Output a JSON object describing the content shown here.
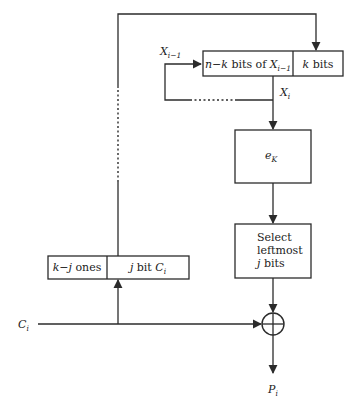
{
  "diagram": {
    "type": "Cipher Feedback (CFB) decryption block diagram",
    "shift_register": {
      "left_segment_label_prefix": "n−k bits of ",
      "left_segment_var": "X",
      "left_segment_sub": "i−1",
      "right_segment_label_var": "k",
      "right_segment_label_suffix": " bits"
    },
    "feedback_input_label": {
      "var": "X",
      "sub": "i−1"
    },
    "register_output_label": {
      "var": "X",
      "sub": "i"
    },
    "encrypt_box": {
      "var": "e",
      "sub": "K"
    },
    "select_box": {
      "line1": "Select",
      "line2": "leftmost",
      "line3_var": "j",
      "line3_suffix": " bits"
    },
    "padding_register": {
      "left_segment_var": "k−j",
      "left_segment_suffix": " ones",
      "right_segment_var": "j",
      "right_segment_mid": " bit ",
      "right_segment_ci_var": "C",
      "right_segment_ci_sub": "i"
    },
    "ciphertext_input": {
      "var": "C",
      "sub": "i"
    },
    "xor_symbol": "⊕",
    "plaintext_output": {
      "var": "P",
      "sub": "i"
    },
    "colors": {
      "stroke": "#2b2b2b",
      "text": "#222222",
      "background": "#ffffff"
    }
  }
}
